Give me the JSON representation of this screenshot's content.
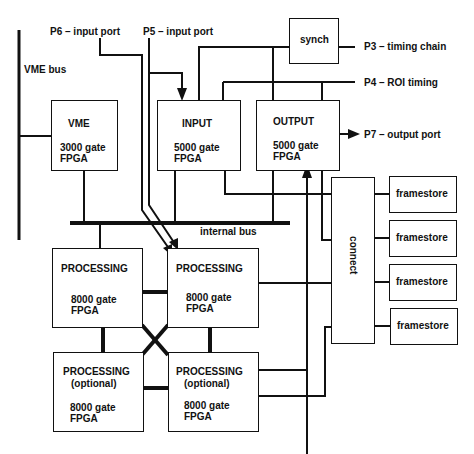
{
  "diagram": {
    "external_labels": {
      "vme_bus": "VME bus",
      "p6": "P6 – input port",
      "p5": "P5 – input port",
      "p3": "P3 – timing chain",
      "p4": "P4 – ROI timing",
      "p7": "P7 – output port",
      "internal_bus": "internal bus"
    },
    "blocks": {
      "synch": {
        "title": "synch"
      },
      "vme": {
        "title": "VME",
        "detail1": "3000 gate",
        "detail2": "FPGA"
      },
      "input": {
        "title": "INPUT",
        "detail1": "5000 gate",
        "detail2": "FPGA"
      },
      "output": {
        "title": "OUTPUT",
        "detail1": "5000 gate",
        "detail2": "FPGA"
      },
      "proc1": {
        "title": "PROCESSING",
        "detail1": "8000 gate",
        "detail2": "FPGA"
      },
      "proc2": {
        "title": "PROCESSING",
        "detail1": "8000 gate",
        "detail2": "FPGA"
      },
      "proc3": {
        "title": "PROCESSING",
        "subtitle": "(optional)",
        "detail1": "8000 gate",
        "detail2": "FPGA"
      },
      "proc4": {
        "title": "PROCESSING",
        "subtitle": "(optional)",
        "detail1": "8000 gate",
        "detail2": "FPGA"
      },
      "connect": {
        "title": "connect"
      },
      "framestores": [
        {
          "title": "framestore"
        },
        {
          "title": "framestore"
        },
        {
          "title": "framestore"
        },
        {
          "title": "framestore"
        }
      ]
    }
  }
}
